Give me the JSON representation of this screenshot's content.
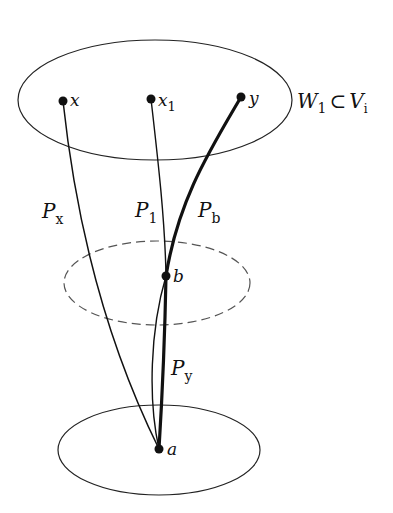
{
  "diagram": {
    "regions": {
      "top": {
        "label_main": "W",
        "label_main_sub": "1",
        "label_subset": "⊂",
        "label_set": "V",
        "label_set_sub": "i",
        "style": "solid"
      },
      "middle": {
        "style": "dashed"
      },
      "bottom": {
        "style": "solid"
      }
    },
    "nodes": {
      "x": {
        "label": "x",
        "sub": ""
      },
      "x1": {
        "label": "x",
        "sub": "1"
      },
      "y": {
        "label": "y",
        "sub": ""
      },
      "b": {
        "label": "b",
        "sub": ""
      },
      "a": {
        "label": "a",
        "sub": ""
      }
    },
    "paths": {
      "Px": {
        "label": "P",
        "sub": "x",
        "from": "a",
        "to": "x",
        "weight": "thin"
      },
      "P1": {
        "label": "P",
        "sub": "1",
        "from": "a",
        "to": "x1",
        "weight": "thin"
      },
      "Pb": {
        "label": "P",
        "sub": "b",
        "from": "b",
        "to": "y",
        "weight": "bold"
      },
      "Py": {
        "label": "P",
        "sub": "y",
        "from": "a",
        "to": "b",
        "weight": "bold"
      }
    },
    "colors": {
      "stroke": "#111111",
      "dashed": "#555555",
      "background": "#ffffff"
    }
  }
}
